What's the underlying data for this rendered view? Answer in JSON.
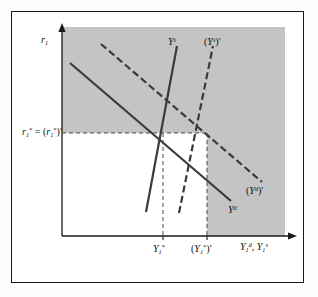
{
  "figure": {
    "kind": "supply-demand-diagram",
    "background_color": "#ffffff",
    "shaded_region_color": "#c4c4c4",
    "line_color": "#333333",
    "border_color": "#1a1a1a"
  },
  "axes": {
    "y_axis_label": "r",
    "y_axis_sub": "1",
    "x_axis_label_demand": "Y",
    "x_axis_demand_sub": "1",
    "x_axis_demand_sup": "d",
    "x_axis_label_supply": "Y",
    "x_axis_supply_sub": "1",
    "x_axis_supply_sup": "s",
    "x_axis_separator": ", ",
    "origin_x": 62,
    "origin_y": 236,
    "x_axis_end": 285,
    "y_axis_end": 27
  },
  "equilibrium": {
    "rate_label_lead": "r",
    "rate_label_sub": "1",
    "rate_label_star": "*",
    "rate_label_eq": " = ",
    "rate_label_prime_open": "(",
    "rate_label_prime_r": "r",
    "rate_label_prime_sub": "1",
    "rate_label_prime_star": "*",
    "rate_label_prime_close": ")'",
    "rate_level_y": 133,
    "output_label": "Y",
    "output_sub": "1",
    "output_star": "*",
    "output_x": 160,
    "output_prime_open": "(",
    "output_prime_Y": "Y",
    "output_prime_sub": "1",
    "output_prime_star": "*",
    "output_prime_close": ")'",
    "output_prime_x": 207
  },
  "curves": [
    {
      "id": "supply-original",
      "label_Y": "Y",
      "label_sup": "s",
      "label_prime": "",
      "style": "solid",
      "label_x": 168,
      "label_y": 38
    },
    {
      "id": "supply-shifted",
      "label_open": "(",
      "label_Y": "Y",
      "label_sup": "s",
      "label_close": ")'",
      "style": "dashed",
      "label_x": 206,
      "label_y": 38
    },
    {
      "id": "demand-original",
      "label_Y": "Y",
      "label_sup": "d",
      "style": "solid",
      "label_x": 228,
      "label_y": 208
    },
    {
      "id": "demand-shifted",
      "label_open": "(",
      "label_Y": "Y",
      "label_sup": "d",
      "label_close": ")'",
      "style": "dashed",
      "label_x": 248,
      "label_y": 188
    }
  ]
}
